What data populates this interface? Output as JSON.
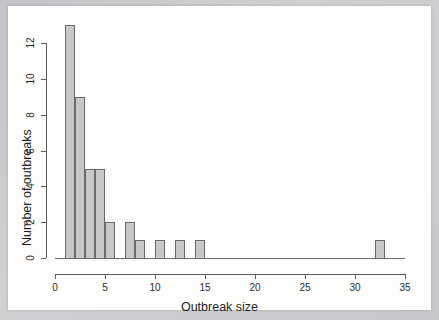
{
  "chart_data": {
    "type": "bar",
    "title": "",
    "subtitle": "",
    "xlabel": "Outbreak size",
    "ylabel": "Number of outbreaks",
    "xlim": [
      0,
      35
    ],
    "ylim": [
      0,
      13
    ],
    "grid": false,
    "legend": null,
    "bin_width": 1,
    "bin_starts": [
      1,
      2,
      3,
      4,
      5,
      6,
      7,
      8,
      9,
      10,
      11,
      12,
      13,
      14,
      15,
      16,
      17,
      18,
      19,
      20,
      21,
      22,
      23,
      24,
      25,
      26,
      27,
      28,
      29,
      30,
      31,
      32,
      33,
      34
    ],
    "categories": [
      "1-2",
      "2-3",
      "3-4",
      "4-5",
      "5-6",
      "6-7",
      "7-8",
      "8-9",
      "9-10",
      "10-11",
      "11-12",
      "12-13",
      "13-14",
      "14-15",
      "15-16",
      "16-17",
      "17-18",
      "18-19",
      "19-20",
      "20-21",
      "21-22",
      "22-23",
      "23-24",
      "24-25",
      "25-26",
      "26-27",
      "27-28",
      "28-29",
      "29-30",
      "30-31",
      "31-32",
      "32-33",
      "33-34",
      "34-35"
    ],
    "values": [
      13,
      9,
      5,
      5,
      2,
      0,
      2,
      1,
      0,
      1,
      0,
      1,
      0,
      1,
      0,
      0,
      0,
      0,
      0,
      0,
      0,
      0,
      0,
      0,
      0,
      0,
      0,
      0,
      0,
      0,
      0,
      1,
      0,
      0
    ],
    "x_ticks": [
      0,
      5,
      10,
      15,
      20,
      25,
      30,
      35
    ],
    "x_tick_labels": [
      "0",
      "5",
      "10",
      "15",
      "20",
      "25",
      "30",
      "35"
    ],
    "y_ticks": [
      0,
      2,
      4,
      6,
      8,
      10,
      12
    ],
    "y_tick_labels": [
      "0",
      "2",
      "4",
      "6",
      "8",
      "10",
      "12"
    ],
    "bar_fill_color": "#c8c8c8",
    "bar_border_color": "#6a6a6a",
    "axis_color": "#5d5d5d",
    "background_color": "#fdfdfc"
  }
}
